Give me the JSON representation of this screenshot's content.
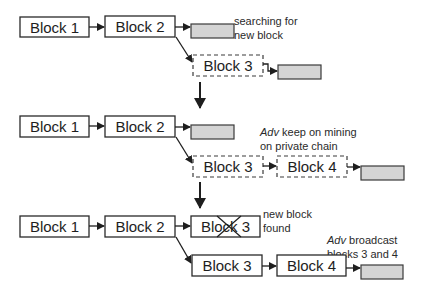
{
  "diagram": {
    "row1": {
      "blocks": [
        {
          "label": "Block 1",
          "style": "solid"
        },
        {
          "label": "Block 2",
          "style": "solid"
        },
        {
          "label": "Block 3",
          "style": "dashed"
        }
      ],
      "note": {
        "line1": "searching for",
        "line2": "new block"
      }
    },
    "row2": {
      "blocks": [
        {
          "label": "Block 1",
          "style": "solid"
        },
        {
          "label": "Block 2",
          "style": "solid"
        },
        {
          "label": "Block 3",
          "style": "dashed"
        },
        {
          "label": "Block 4",
          "style": "dashed"
        }
      ],
      "note": {
        "italic": "Adv",
        "line1_rest": " keep on mining",
        "line2": "on private chain"
      }
    },
    "row3": {
      "blocks": [
        {
          "label": "Block 1",
          "style": "solid"
        },
        {
          "label": "Block 2",
          "style": "solid"
        },
        {
          "label": "Block 3",
          "style": "solid-crossed"
        },
        {
          "label": "Block 3",
          "style": "solid"
        },
        {
          "label": "Block 4",
          "style": "solid"
        }
      ],
      "note_found": {
        "line1": "new block",
        "line2": "found"
      },
      "note_broadcast": {
        "italic": "Adv",
        "line1_rest": " broadcast",
        "line2": "blocks 3 and 4"
      }
    },
    "colors": {
      "pending_block_fill": "#d4d4d4",
      "stroke": "#2a2a2a"
    }
  }
}
